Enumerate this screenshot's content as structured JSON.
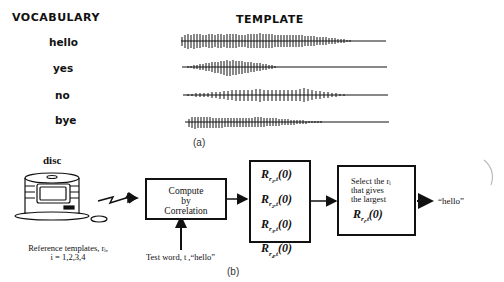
{
  "part_a": {
    "headers": {
      "vocabulary": "VOCABULARY",
      "template": "TEMPLATE"
    },
    "words": [
      {
        "label": "hello"
      },
      {
        "label": "yes"
      },
      {
        "label": "no"
      },
      {
        "label": "bye"
      }
    ],
    "caption": "(a)"
  },
  "part_b": {
    "disc_label": "disc",
    "reference_caption_line1": "Reference templates, rᵢ,",
    "reference_caption_line2": "i = 1,2,3,4",
    "compute_box": {
      "line1": "Compute",
      "line2": "by",
      "line3": "Correlation"
    },
    "test_word_label": "Test word, t ,“hello”",
    "correlation_terms": [
      {
        "base": "R",
        "sub_r": "r",
        "sub_i": "1",
        "sub_t": "t",
        "arg": "(0)"
      },
      {
        "base": "R",
        "sub_r": "r",
        "sub_i": "2",
        "sub_t": "t",
        "arg": "(0)"
      },
      {
        "base": "R",
        "sub_r": "r",
        "sub_i": "3",
        "sub_t": "t",
        "arg": "(0)"
      },
      {
        "base": "R",
        "sub_r": "r",
        "sub_i": "4",
        "sub_t": "t",
        "arg": "(0)"
      }
    ],
    "select_box": {
      "line1": "Select the rᵢ",
      "line2": "that gives",
      "line3": "the largest",
      "term": {
        "base": "R",
        "sub_r": "r",
        "sub_i": "i",
        "sub_t": "t",
        "arg": "(0)"
      }
    },
    "output_label": "“hello”",
    "caption": "(b)"
  }
}
